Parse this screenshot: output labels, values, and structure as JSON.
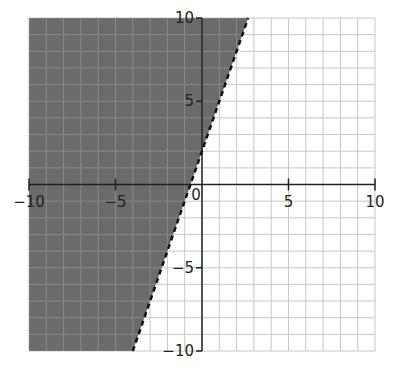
{
  "chart_data": {
    "type": "line",
    "title": "",
    "xlabel": "",
    "ylabel": "",
    "xlim": [
      -10,
      10
    ],
    "ylim": [
      -10,
      10
    ],
    "grid": true,
    "grid_step": 1,
    "x_ticks": [
      -10,
      -5,
      0,
      5,
      10
    ],
    "y_ticks": [
      10,
      5,
      -5,
      -10
    ],
    "x_tick_labels": [
      "−10",
      "−5",
      "0",
      "5",
      "10"
    ],
    "y_tick_labels": [
      "10",
      "5",
      "−5",
      "−10"
    ],
    "series": [
      {
        "name": "boundary y = 3x + 2",
        "style": "dashed",
        "slope": 3,
        "intercept": 2,
        "points": [
          [
            -4,
            -10
          ],
          [
            2.667,
            10
          ]
        ]
      }
    ],
    "shaded_region": {
      "inequality": "y > 3x + 2",
      "side": "left/above line",
      "color": "#6b6b6b"
    },
    "colors": {
      "shade": "#6b6b6b",
      "grid": "#c8c8c8",
      "axis": "#222222",
      "line": "#111111"
    }
  }
}
